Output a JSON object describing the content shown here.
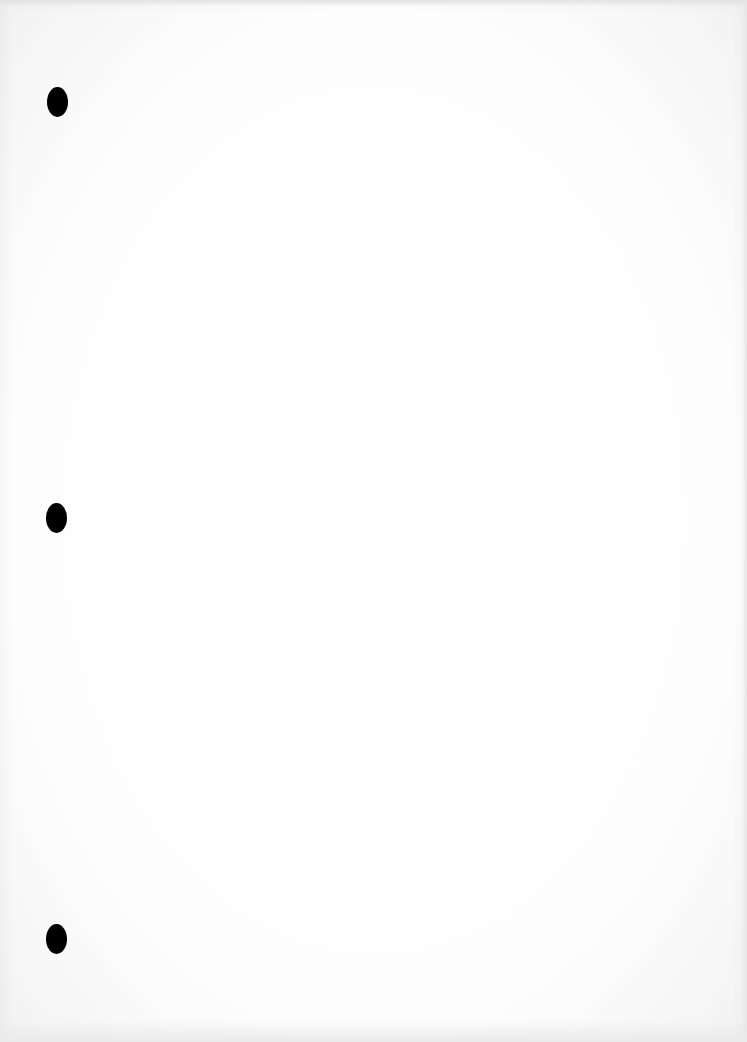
{
  "page": {
    "background_color": "#fefefe",
    "text": ""
  },
  "punch_holes": [
    {
      "cx": 57,
      "cy": 102,
      "color": "#000000"
    },
    {
      "cx": 56,
      "cy": 518,
      "color": "#000000"
    },
    {
      "cx": 56,
      "cy": 939,
      "color": "#000000"
    }
  ]
}
